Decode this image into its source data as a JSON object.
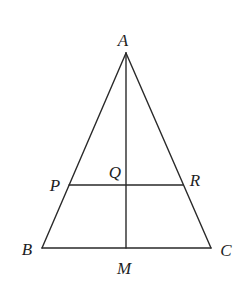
{
  "diagram": {
    "type": "isosceles triangle with median and transversal",
    "points": {
      "A": {
        "label": "A",
        "x": 126,
        "y": 53,
        "label_x": 123,
        "label_y": 46
      },
      "B": {
        "label": "B",
        "x": 42,
        "y": 248,
        "label_x": 27,
        "label_y": 255
      },
      "C": {
        "label": "C",
        "x": 211,
        "y": 248,
        "label_x": 226,
        "label_y": 256
      },
      "M": {
        "label": "M",
        "x": 126,
        "y": 248,
        "label_x": 124,
        "label_y": 274
      },
      "P": {
        "label": "P",
        "x": 69,
        "y": 185,
        "label_x": 55,
        "label_y": 191
      },
      "Q": {
        "label": "Q",
        "x": 126,
        "y": 185,
        "label_x": 115,
        "label_y": 178
      },
      "R": {
        "label": "R",
        "x": 183,
        "y": 185,
        "label_x": 195,
        "label_y": 186
      }
    },
    "segments": [
      {
        "name": "AB",
        "from": "A",
        "to": "B"
      },
      {
        "name": "AC",
        "from": "A",
        "to": "C"
      },
      {
        "name": "BC",
        "from": "B",
        "to": "C"
      },
      {
        "name": "AM",
        "from": "A",
        "to": "M"
      },
      {
        "name": "PR",
        "from": "P",
        "to": "R"
      }
    ],
    "colors": {
      "stroke": "#2a2a2a",
      "label": "#1e1e1e",
      "background": "#ffffff"
    }
  }
}
